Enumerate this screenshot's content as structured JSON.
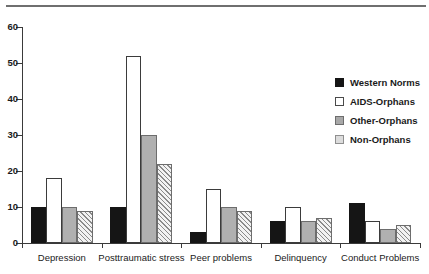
{
  "chart_data": {
    "type": "bar",
    "title": "",
    "subtitle": "",
    "xlabel": "",
    "ylabel": "",
    "ylim": [
      0,
      60
    ],
    "yticks": [
      0,
      10,
      20,
      30,
      40,
      50,
      60
    ],
    "grid": false,
    "legend_position": "right",
    "categories": [
      "Depression",
      "Posttraumatic stress",
      "Peer problems",
      "Delinquency",
      "Conduct Problems"
    ],
    "series": [
      {
        "name": "Western Norms",
        "color": "#151515",
        "fill": "solid-black",
        "values": [
          10,
          10,
          3,
          6,
          11
        ]
      },
      {
        "name": "AIDS-Orphans",
        "color": "#ffffff",
        "fill": "white-outline",
        "values": [
          18,
          52,
          15,
          10,
          6
        ]
      },
      {
        "name": "Other-Orphans",
        "color": "#b0b0b0",
        "fill": "solid-gray",
        "values": [
          10,
          30,
          10,
          6,
          4
        ]
      },
      {
        "name": "Non-Orphans",
        "color": "#f2f2f2",
        "fill": "diagonal-hatch",
        "values": [
          9,
          22,
          9,
          7,
          5
        ]
      }
    ]
  },
  "axis": {
    "y_tick_labels": [
      "0",
      "10",
      "20",
      "30",
      "40",
      "50",
      "60"
    ]
  },
  "legend": {
    "items": [
      {
        "label": "Western Norms",
        "swatch": "solid-black-swatch"
      },
      {
        "label": "AIDS-Orphans",
        "swatch": "white-outline-swatch"
      },
      {
        "label": "Other-Orphans",
        "swatch": "solid-gray-swatch"
      },
      {
        "label": "Non-Orphans",
        "swatch": "light-gray-swatch"
      }
    ]
  }
}
